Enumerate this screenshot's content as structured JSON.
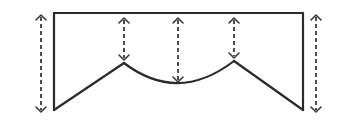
{
  "diagram": {
    "title": "",
    "colors": {
      "stroke": "#2a2a2a",
      "dashed": "#3a3a3a",
      "background": "#ffffff"
    },
    "outline": {
      "top_line": {
        "x1": 54,
        "y1": 13,
        "x2": 303,
        "y2": 13
      },
      "left_side": {
        "x1": 54,
        "y1": 13,
        "x2": 54,
        "y2": 110
      },
      "right_side": {
        "x1": 303,
        "y1": 13,
        "x2": 303,
        "y2": 110
      },
      "left_slope": {
        "x1": 54,
        "y1": 110,
        "x2": 124,
        "y2": 63
      },
      "center_arc": {
        "x1": 124,
        "y1": 63,
        "cx": 178,
        "cy": 104,
        "x2": 234,
        "y2": 61
      },
      "right_slope": {
        "x1": 234,
        "y1": 61,
        "x2": 303,
        "y2": 110
      }
    },
    "measurement_arrows": [
      {
        "name": "left-outer-drop",
        "x": 41,
        "y1": 15,
        "y2": 112
      },
      {
        "name": "left-peak-drop",
        "x": 124,
        "y1": 18,
        "y2": 60
      },
      {
        "name": "center-drop",
        "x": 178,
        "y1": 18,
        "y2": 82
      },
      {
        "name": "right-peak-drop",
        "x": 234,
        "y1": 18,
        "y2": 58
      },
      {
        "name": "right-outer-drop",
        "x": 316,
        "y1": 15,
        "y2": 112
      }
    ],
    "labels": []
  }
}
